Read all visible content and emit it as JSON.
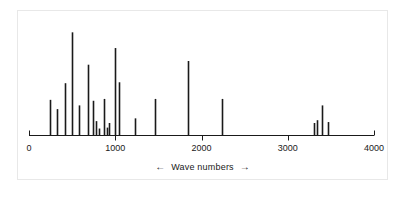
{
  "figure": {
    "caption_text": "Wave numbers",
    "caption_arrow_left": "←",
    "caption_arrow_right": "→",
    "background_color": "#ffffff",
    "frame_color": "#e8e8e8",
    "line_color": "#1a1a1a"
  },
  "chart_data": {
    "type": "bar",
    "subtype": "stick-spectrum",
    "title": "",
    "subtitle": "",
    "xlabel": "Wave numbers",
    "ylabel": "",
    "xlim": [
      0,
      4000
    ],
    "ylim": [
      0,
      120
    ],
    "xticks": [
      0,
      1000,
      2000,
      3000,
      4000
    ],
    "xtick_labels": [
      "0",
      "1000",
      "2000",
      "3000",
      "4000"
    ],
    "yticks": [],
    "ytick_labels": [],
    "grid": false,
    "legend": null,
    "legend_position": "none",
    "y_axis_visible": false,
    "x": [
      245,
      325,
      420,
      500,
      580,
      685,
      740,
      780,
      810,
      870,
      905,
      930,
      995,
      1045,
      1230,
      1460,
      1840,
      2235,
      3310,
      3335,
      3400,
      3465
    ],
    "values": [
      38,
      28,
      56,
      111,
      32,
      76,
      37,
      15,
      7,
      39,
      8,
      13,
      94,
      57,
      18,
      39,
      80,
      39,
      13,
      16,
      32,
      14
    ],
    "series": [
      {
        "name": "Intensity",
        "color": "#1a1a1a",
        "values": [
          38,
          28,
          56,
          111,
          32,
          76,
          37,
          15,
          7,
          39,
          8,
          13,
          94,
          57,
          18,
          39,
          80,
          39,
          13,
          16,
          32,
          14
        ]
      }
    ],
    "annotations": []
  }
}
